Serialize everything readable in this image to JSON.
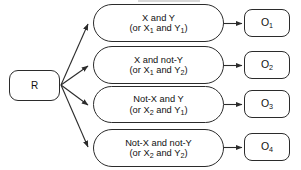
{
  "diagram": {
    "type": "flowchart",
    "root": {
      "id": "R",
      "label": "R"
    },
    "conditions": [
      {
        "id": "cond-1",
        "line1": "X and Y",
        "line2_prefix": "(or X",
        "line2_sub1": "1",
        "line2_mid": " and Y",
        "line2_sub2": "1",
        "line2_suffix": ")"
      },
      {
        "id": "cond-2",
        "line1": "X and not-Y",
        "line2_prefix": "(or X",
        "line2_sub1": "1",
        "line2_mid": " and Y",
        "line2_sub2": "2",
        "line2_suffix": ")"
      },
      {
        "id": "cond-3",
        "line1": "Not-X and Y",
        "line2_prefix": "(or X",
        "line2_sub1": "2",
        "line2_mid": " and Y",
        "line2_sub2": "1",
        "line2_suffix": ")"
      },
      {
        "id": "cond-4",
        "line1": "Not-X and not-Y",
        "line2_prefix": "(or X",
        "line2_sub1": "2",
        "line2_mid": " and Y",
        "line2_sub2": "2",
        "line2_suffix": ")"
      }
    ],
    "outcomes": [
      {
        "id": "out-1",
        "label_prefix": "O",
        "label_sub": "1"
      },
      {
        "id": "out-2",
        "label_prefix": "O",
        "label_sub": "2"
      },
      {
        "id": "out-3",
        "label_prefix": "O",
        "label_sub": "3"
      },
      {
        "id": "out-4",
        "label_prefix": "O",
        "label_sub": "4"
      }
    ],
    "colors": {
      "stroke": "#2b2b2b",
      "text": "#111111",
      "background": "#ffffff"
    }
  }
}
